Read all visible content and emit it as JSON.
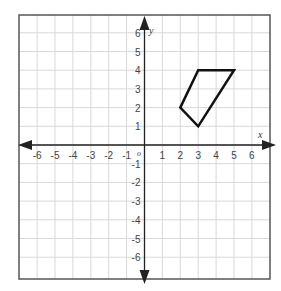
{
  "chart_data": {
    "type": "scatter",
    "title": "",
    "xlabel": "x",
    "ylabel": "y",
    "origin_label": "o",
    "xlim": [
      -7,
      7
    ],
    "ylim": [
      -7,
      7
    ],
    "grid": true,
    "x_ticks": [
      -6,
      -5,
      -4,
      -3,
      -2,
      -1,
      1,
      2,
      3,
      4,
      5,
      6
    ],
    "y_ticks": [
      6,
      5,
      4,
      3,
      2,
      1,
      -1,
      -2,
      -3,
      -4,
      -5,
      -6
    ],
    "shapes": [
      {
        "name": "quadrilateral",
        "kind": "polygon",
        "vertices": [
          [
            3,
            4
          ],
          [
            5,
            4
          ],
          [
            3,
            1
          ],
          [
            2,
            2
          ]
        ]
      }
    ]
  },
  "colors": {
    "grid": "#d8d8d8",
    "border": "#555555",
    "axis": "#222222",
    "shape": "#111111"
  }
}
